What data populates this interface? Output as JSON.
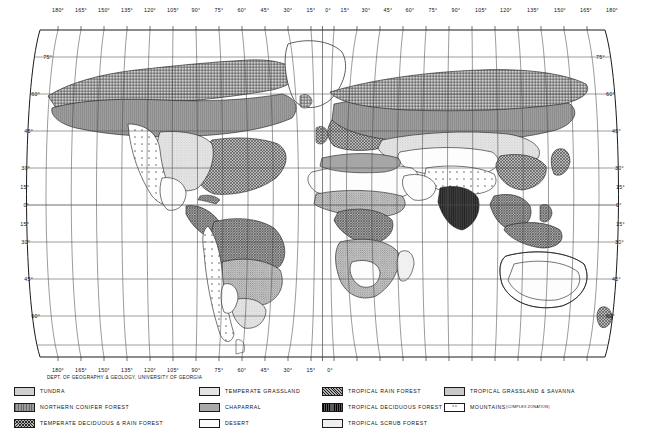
{
  "map": {
    "title": "World Natural Vegetation / Biome Map",
    "credit": "DEPT. OF GEOGRAPHY & GEOLOGY, UNIVERSITY OF GEORGIA",
    "projection": "sinusoidal-pseudocylindrical",
    "graticule_interval_deg": 15,
    "longitude_labels": [
      "180°",
      "165°",
      "150°",
      "135°",
      "120°",
      "105°",
      "90°",
      "75°",
      "60°",
      "45°",
      "30°",
      "15°",
      "0°",
      "15°",
      "30°",
      "45°",
      "60°",
      "75°",
      "90°",
      "105°",
      "120°",
      "135°",
      "150°",
      "165°",
      "180°"
    ],
    "latitude_labels_left": [
      "60°",
      "45°",
      "30°",
      "15°",
      "0°",
      "15°",
      "30°",
      "45°",
      "60°"
    ],
    "latitude_labels_right": [
      "60°",
      "45°",
      "30°",
      "15°",
      "0°",
      "15°",
      "30°",
      "45°",
      "60°"
    ],
    "latitude_label_75_left": "75°",
    "latitude_label_75_right": "75°"
  },
  "legend": {
    "columns": [
      {
        "items": [
          {
            "label": "TUNDRA",
            "pattern": "p-tundra"
          },
          {
            "label": "NORTHERN CONIFER FOREST",
            "pattern": "p-conifer"
          },
          {
            "label": "TEMPERATE DECIDUOUS & RAIN FOREST",
            "pattern": "p-tempdecid"
          }
        ]
      },
      {
        "items": [
          {
            "label": "TEMPERATE GRASSLAND",
            "pattern": "p-tempgrass"
          },
          {
            "label": "CHAPARRAL",
            "pattern": "p-chaparral"
          },
          {
            "label": "DESERT",
            "pattern": "p-desert"
          }
        ]
      },
      {
        "items": [
          {
            "label": "TROPICAL RAIN FOREST",
            "pattern": "p-trainforest"
          },
          {
            "label": "TROPICAL DECIDUOUS FOREST",
            "pattern": "p-tdecid"
          },
          {
            "label": "TROPICAL SCRUB FOREST",
            "pattern": "p-tscrub"
          }
        ]
      },
      {
        "items": [
          {
            "label": "TROPICAL GRASSLAND & SAVANNA",
            "pattern": "p-tgrass"
          },
          {
            "label": "MOUNTAINS",
            "sub": "(COMPLEX ZONATION)",
            "pattern": "p-mountain",
            "glyph": "ʌ  ʌ"
          }
        ]
      }
    ]
  },
  "colors": {
    "ink": "#111111",
    "graticule": "#4a4a4a",
    "coast": "#1a1a1a",
    "background": "#ffffff"
  }
}
